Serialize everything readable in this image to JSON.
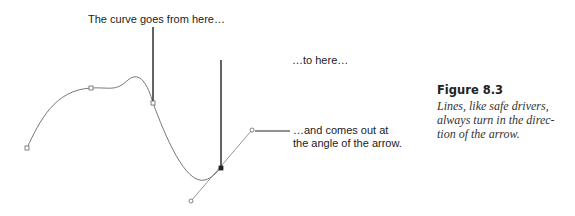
{
  "annotations": {
    "start": "The curve goes from here…",
    "end": "…to here…",
    "angle_line1": "…and comes out at",
    "angle_line2": "the angle of the arrow."
  },
  "caption": {
    "title": "Figure 8.3",
    "text": "Lines, like safe drivers,\nalways turn in the direc-\ntion of the arrow."
  },
  "colors": {
    "curve": "#777777",
    "leader": "#222222",
    "text": "#222222"
  }
}
